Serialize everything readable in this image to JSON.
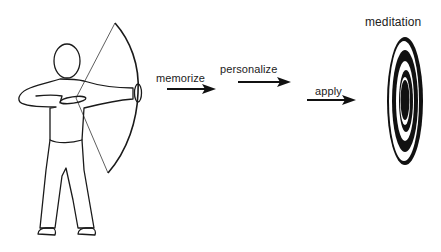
{
  "diagram": {
    "steps": [
      {
        "label": "memorize"
      },
      {
        "label": "personalize"
      },
      {
        "label": "apply"
      }
    ],
    "target_label": "meditation",
    "figure": "archer drawing bow",
    "colors": {
      "ink": "#111111",
      "background": "#ffffff"
    }
  }
}
